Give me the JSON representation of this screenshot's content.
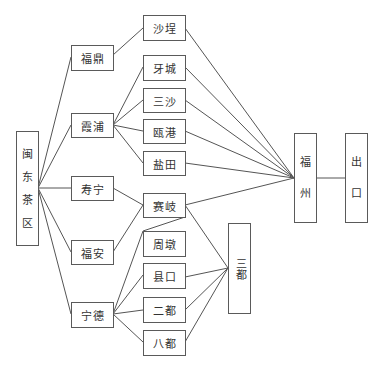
{
  "diagram": {
    "title": "",
    "nodes": {
      "mindong": {
        "label": "闽东茶区",
        "chars": [
          "闽",
          "东",
          "茶",
          "区"
        ]
      },
      "fuding": {
        "label": "福鼎"
      },
      "xiapu": {
        "label": "霞浦"
      },
      "shouning": {
        "label": "寿宁"
      },
      "fuan": {
        "label": "福安"
      },
      "ningde": {
        "label": "宁德"
      },
      "shacheng": {
        "label": "沙埕"
      },
      "yacheng": {
        "label": "牙城"
      },
      "sansha": {
        "label": "三沙"
      },
      "ougang": {
        "label": "瓯港"
      },
      "yantian": {
        "label": "盐田"
      },
      "saiqi": {
        "label": "赛岐"
      },
      "zhoudun": {
        "label": "周墩"
      },
      "xiankou": {
        "label": "县口"
      },
      "erdu": {
        "label": "二都"
      },
      "badu": {
        "label": "八都"
      },
      "sandu": {
        "label": "三都"
      },
      "fuzhou": {
        "label": "福州",
        "chars": [
          "福",
          "州"
        ]
      },
      "chukou": {
        "label": "出口",
        "chars": [
          "出",
          "口"
        ]
      }
    },
    "edges": [
      [
        "闽东茶区",
        "福鼎"
      ],
      [
        "闽东茶区",
        "霞浦"
      ],
      [
        "闽东茶区",
        "寿宁"
      ],
      [
        "闽东茶区",
        "福安"
      ],
      [
        "闽东茶区",
        "宁德"
      ],
      [
        "福鼎",
        "沙埕"
      ],
      [
        "霞浦",
        "牙城"
      ],
      [
        "霞浦",
        "三沙"
      ],
      [
        "霞浦",
        "瓯港"
      ],
      [
        "霞浦",
        "盐田"
      ],
      [
        "寿宁",
        "赛岐"
      ],
      [
        "福安",
        "赛岐"
      ],
      [
        "宁德",
        "赛岐"
      ],
      [
        "宁德",
        "周墩"
      ],
      [
        "宁德",
        "县口"
      ],
      [
        "宁德",
        "二都"
      ],
      [
        "宁德",
        "八都"
      ],
      [
        "沙埕",
        "福州"
      ],
      [
        "牙城",
        "福州"
      ],
      [
        "三沙",
        "福州"
      ],
      [
        "瓯港",
        "福州"
      ],
      [
        "盐田",
        "福州"
      ],
      [
        "赛岐",
        "福州"
      ],
      [
        "赛岐",
        "三都"
      ],
      [
        "县口",
        "三都"
      ],
      [
        "二都",
        "三都"
      ],
      [
        "八都",
        "三都"
      ],
      [
        "福州",
        "出口"
      ]
    ]
  }
}
